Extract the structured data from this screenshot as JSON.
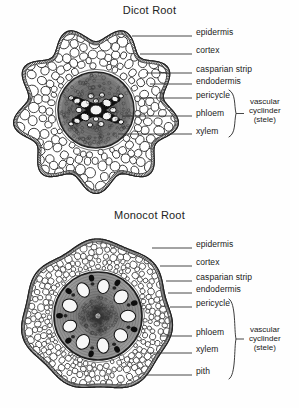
{
  "document": {
    "background_color": "#fefefe",
    "ink_color": "#191919"
  },
  "figures": [
    {
      "id": "dicot",
      "title": "Dicot Root",
      "specimen_type": "root cross section",
      "outline_shape": "lobed",
      "labels": [
        {
          "name": "epidermis",
          "text": "epidermis",
          "x": 196,
          "y": 33,
          "leader_from_x": 132,
          "leader_to_x": 192,
          "leader_y": 36
        },
        {
          "name": "cortex",
          "text": "cortex",
          "x": 196,
          "y": 51,
          "leader_from_x": 140,
          "leader_to_x": 192,
          "leader_y": 54
        },
        {
          "name": "casparian-strip",
          "text": "casparian strip",
          "x": 196,
          "y": 70,
          "leader_from_x": 146,
          "leader_to_x": 192,
          "leader_y": 73
        },
        {
          "name": "endodermis",
          "text": "endodermis",
          "x": 196,
          "y": 81,
          "leader_from_x": 150,
          "leader_to_x": 192,
          "leader_y": 84
        },
        {
          "name": "pericycle",
          "text": "pericycle",
          "x": 196,
          "y": 95,
          "leader_from_x": 140,
          "leader_to_x": 192,
          "leader_y": 98
        },
        {
          "name": "phloem",
          "text": "phloem",
          "x": 196,
          "y": 113,
          "leader_from_x": 122,
          "leader_to_x": 192,
          "leader_y": 116
        },
        {
          "name": "xylem",
          "text": "xylem",
          "x": 196,
          "y": 131,
          "leader_from_x": 118,
          "leader_to_x": 192,
          "leader_y": 134
        }
      ],
      "group": {
        "name": "vascular-cylinder",
        "lines": [
          "vascular",
          "cyclinder",
          "(stele)"
        ],
        "brace_top": 90,
        "brace_bottom": 137,
        "brace_x": 236,
        "text_x": 249,
        "text_y": 104,
        "members": [
          "pericycle",
          "phloem",
          "xylem"
        ]
      },
      "structures": {
        "xylem_color": "#f2f2f2",
        "phloem_color": "#111111",
        "stele_tone": "#6e6e6e",
        "cortex_tone": "#ffffff"
      }
    },
    {
      "id": "monocot",
      "title": "Monocot Root",
      "specimen_type": "root cross section",
      "outline_shape": "circular",
      "labels": [
        {
          "name": "epidermis",
          "text": "epidermis",
          "x": 196,
          "y": 41,
          "leader_from_x": 152,
          "leader_to_x": 192,
          "leader_y": 44
        },
        {
          "name": "cortex",
          "text": "cortex",
          "x": 196,
          "y": 59,
          "leader_from_x": 160,
          "leader_to_x": 192,
          "leader_y": 62
        },
        {
          "name": "casparian-strip",
          "text": "casparian strip",
          "x": 196,
          "y": 74,
          "leader_from_x": 166,
          "leader_to_x": 192,
          "leader_y": 77
        },
        {
          "name": "endodermis",
          "text": "endodermis",
          "x": 196,
          "y": 86,
          "leader_from_x": 168,
          "leader_to_x": 192,
          "leader_y": 89
        },
        {
          "name": "pericycle",
          "text": "pericycle",
          "x": 196,
          "y": 100,
          "leader_from_x": 170,
          "leader_to_x": 192,
          "leader_y": 103
        },
        {
          "name": "phloem",
          "text": "phloem",
          "x": 196,
          "y": 129,
          "leader_from_x": 160,
          "leader_to_x": 192,
          "leader_y": 132
        },
        {
          "name": "xylem",
          "text": "xylem",
          "x": 196,
          "y": 146,
          "leader_from_x": 150,
          "leader_to_x": 192,
          "leader_y": 149
        },
        {
          "name": "pith",
          "text": "pith",
          "x": 196,
          "y": 168,
          "leader_from_x": 146,
          "leader_to_x": 192,
          "leader_y": 171
        }
      ],
      "group": {
        "name": "vascular-cylinder",
        "lines": [
          "vascular",
          "cyclinder",
          "(stele)"
        ],
        "brace_top": 95,
        "brace_bottom": 175,
        "brace_x": 236,
        "text_x": 249,
        "text_y": 128,
        "members": [
          "pericycle",
          "phloem",
          "xylem",
          "pith"
        ]
      },
      "structures": {
        "xylem_color": "#f6f6f6",
        "phloem_color": "#0d0d0d",
        "stele_tone": "#757575",
        "cortex_tone": "#ffffff"
      }
    }
  ]
}
